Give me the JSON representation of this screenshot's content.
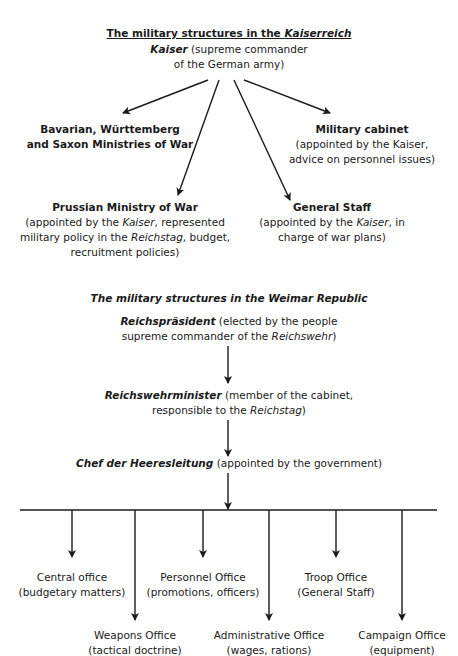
{
  "kaiserreich": {
    "title_prefix": "The military structures in the ",
    "title_italic": "Kaiserreich",
    "kaiser": {
      "name": "Kaiser",
      "desc_line1": " (supreme commander",
      "desc_line2": "of the German army)"
    },
    "bavarian": {
      "line1": "Bavarian, Württemberg",
      "line2": "and Saxon Ministries of War"
    },
    "military_cabinet": {
      "name": "Military cabinet",
      "line1": "(appointed by the Kaiser,",
      "line2": "advice on personnel issues)"
    },
    "prussian": {
      "name": "Prussian Ministry of War",
      "line1_a": "(appointed by the ",
      "line1_i": "Kaiser",
      "line1_b": ", represented",
      "line2_a": "military policy in the ",
      "line2_i": "Reichstag",
      "line2_b": ", budget,",
      "line3": "recruitment policies)"
    },
    "general_staff": {
      "name": "General Staff",
      "line1_a": "(appointed by the ",
      "line1_i": "Kaiser",
      "line1_b": ", in",
      "line2": "charge of war plans)"
    }
  },
  "weimar": {
    "title": "The military structures in the Weimar Republic",
    "praesident": {
      "name": "Reichspräsident",
      "line1": " (elected by the people",
      "line2_a": "supreme commander of the ",
      "line2_i": "Reichswehr",
      "line2_b": ")"
    },
    "minister": {
      "name": "Reichswehrminister",
      "line1": " (member of the cabinet,",
      "line2_a": "responsible to the ",
      "line2_i": "Reichstag",
      "line2_b": ")"
    },
    "chef": {
      "name": "Chef der Heeresleitung",
      "desc": " (appointed by the government)"
    },
    "offices": [
      {
        "name": "Central office",
        "desc": "(budgetary matters)"
      },
      {
        "name": "Weapons Office",
        "desc": "(tactical doctrine)"
      },
      {
        "name": "Personnel Office",
        "desc": "(promotions, officers)"
      },
      {
        "name": "Administrative Office",
        "desc": "(wages, rations)"
      },
      {
        "name": "Troop Office",
        "desc": "(General Staff)"
      },
      {
        "name": "Campaign Office",
        "desc": "(equipment)"
      }
    ]
  },
  "colors": {
    "text": "#1a1a1a",
    "lines": "#1a1a1a",
    "background": "#ffffff"
  }
}
